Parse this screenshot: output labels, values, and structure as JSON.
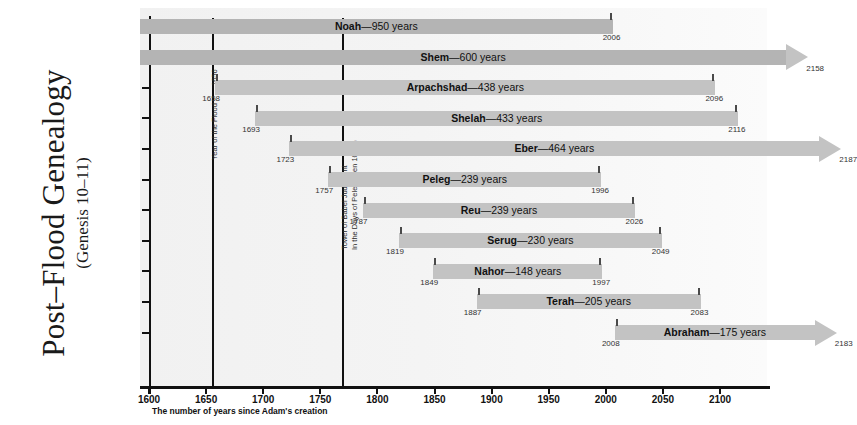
{
  "title": {
    "main": "Post–Flood Genealogy",
    "sub": "(Genesis 10–11)"
  },
  "axis": {
    "caption": "The number of years since Adam's creation",
    "ticks": [
      1600,
      1650,
      1700,
      1750,
      1800,
      1850,
      1900,
      1950,
      2000,
      2050,
      2100
    ],
    "tick_labels": [
      "1600",
      "1650",
      "1700",
      "1750",
      "1800",
      "1850",
      "1900",
      "1950",
      "2000",
      "2050",
      "2100"
    ],
    "min": 1600,
    "max": 2120
  },
  "events": [
    {
      "year": 1656,
      "number": "1656",
      "label": "Year of the Flood",
      "label2": ""
    },
    {
      "year": 1770,
      "number": "",
      "label": "Tower of Babel Judgment",
      "label2": "In the Days of Peleg (Gen 10:25)"
    }
  ],
  "chart_data": {
    "type": "bar",
    "title": "Post–Flood Genealogy (Genesis 10–11)",
    "xlabel": "The number of years since Adam's creation",
    "ylabel": "",
    "xlim": [
      1600,
      2120
    ],
    "grid": false,
    "orientation": "horizontal-timeline",
    "categories": [
      "Noah",
      "Shem",
      "Arpachshad",
      "Shelah",
      "Eber",
      "Peleg",
      "Reu",
      "Serug",
      "Nahor",
      "Terah",
      "Abraham"
    ],
    "bars": [
      {
        "name": "Noah",
        "lifespan": 950,
        "label": "Noah—950 years",
        "start": 1056,
        "end": 2006,
        "start_label": "",
        "end_label": "2006",
        "clipped_left": true,
        "arrow_right": false
      },
      {
        "name": "Shem",
        "lifespan": 600,
        "label": "Shem—600 years",
        "start": 1558,
        "end": 2158,
        "start_label": "",
        "end_label": "2158",
        "clipped_left": true,
        "arrow_right": true
      },
      {
        "name": "Arpachshad",
        "lifespan": 438,
        "label": "Arpachshad—438 years",
        "start": 1658,
        "end": 2096,
        "start_label": "1658",
        "end_label": "2096",
        "clipped_left": false,
        "arrow_right": false
      },
      {
        "name": "Shelah",
        "lifespan": 433,
        "label": "Shelah—433 years",
        "start": 1693,
        "end": 2116,
        "start_label": "1693",
        "end_label": "2116",
        "clipped_left": false,
        "arrow_right": false
      },
      {
        "name": "Eber",
        "lifespan": 464,
        "label": "Eber—464 years",
        "start": 1723,
        "end": 2187,
        "start_label": "1723",
        "end_label": "2187",
        "clipped_left": false,
        "arrow_right": true
      },
      {
        "name": "Peleg",
        "lifespan": 239,
        "label": "Peleg—239 years",
        "start": 1757,
        "end": 1996,
        "start_label": "1757",
        "end_label": "1996",
        "clipped_left": false,
        "arrow_right": false
      },
      {
        "name": "Reu",
        "lifespan": 239,
        "label": "Reu—239 years",
        "start": 1787,
        "end": 2026,
        "start_label": "1787",
        "end_label": "2026",
        "clipped_left": false,
        "arrow_right": false
      },
      {
        "name": "Serug",
        "lifespan": 230,
        "label": "Serug—230 years",
        "start": 1819,
        "end": 2049,
        "start_label": "1819",
        "end_label": "2049",
        "clipped_left": false,
        "arrow_right": false
      },
      {
        "name": "Nahor",
        "lifespan": 148,
        "label": "Nahor—148 years",
        "start": 1849,
        "end": 1997,
        "start_label": "1849",
        "end_label": "1997",
        "clipped_left": false,
        "arrow_right": false
      },
      {
        "name": "Terah",
        "lifespan": 205,
        "label": "Terah—205 years",
        "start": 1887,
        "end": 2083,
        "start_label": "1887",
        "end_label": "2083",
        "clipped_left": false,
        "arrow_right": false
      },
      {
        "name": "Abraham",
        "lifespan": 175,
        "label": "Abraham—175 years",
        "start": 2008,
        "end": 2183,
        "start_label": "2008",
        "end_label": "2183",
        "clipped_left": false,
        "arrow_right": true
      }
    ]
  },
  "colors": {
    "bar": "#c3c3c3",
    "bar_highlight": "#b4b4b4",
    "axis": "#111111",
    "plot_bg": "#f3f3f3"
  }
}
